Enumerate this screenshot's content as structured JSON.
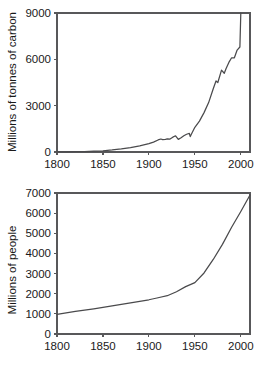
{
  "figure": {
    "background_color": "#ffffff",
    "line_color": "#4a4a4c",
    "axis_color": "#58585a",
    "text_color": "#1a1a1a"
  },
  "chart_data": [
    {
      "id": "carbon",
      "type": "line",
      "title": "",
      "xlabel": "",
      "ylabel": "Millions of tonnes of carbon",
      "xlim": [
        1800,
        2010
      ],
      "ylim": [
        0,
        9000
      ],
      "xticks": [
        1800,
        1850,
        1900,
        1950,
        2000
      ],
      "xticklabels": [
        "1800",
        "1850",
        "1900",
        "1950",
        "2000"
      ],
      "yticks": [
        0,
        3000,
        6000,
        9000
      ],
      "yticklabels": [
        "0",
        "3000",
        "6000",
        "9000"
      ],
      "grid": false,
      "legend": false,
      "series": [
        {
          "name": "Global carbon emissions from fossil fuels",
          "x": [
            1800,
            1810,
            1820,
            1830,
            1840,
            1850,
            1860,
            1870,
            1880,
            1890,
            1900,
            1905,
            1910,
            1913,
            1915,
            1918,
            1920,
            1923,
            1926,
            1929,
            1932,
            1935,
            1938,
            1941,
            1944,
            1945,
            1947,
            1950,
            1955,
            1960,
            1965,
            1970,
            1973,
            1975,
            1979,
            1982,
            1984,
            1987,
            1990,
            1993,
            1996,
            1999,
            2000
          ],
          "y": [
            8,
            12,
            18,
            30,
            50,
            80,
            130,
            200,
            290,
            400,
            540,
            640,
            780,
            840,
            800,
            820,
            850,
            840,
            960,
            1050,
            820,
            920,
            1050,
            1150,
            1200,
            1000,
            1250,
            1600,
            2000,
            2550,
            3200,
            4100,
            4600,
            4500,
            5300,
            5100,
            5400,
            5800,
            6100,
            6100,
            6600,
            6800,
            9000
          ]
        }
      ]
    },
    {
      "id": "population",
      "type": "line",
      "title": "",
      "xlabel": "",
      "ylabel": "Millions of people",
      "xlim": [
        1800,
        2010
      ],
      "ylim": [
        0,
        7000
      ],
      "xticks": [
        1800,
        1850,
        1900,
        1950,
        2000
      ],
      "xticklabels": [
        "1800",
        "1850",
        "1900",
        "1950",
        "2000"
      ],
      "yticks": [
        0,
        1000,
        2000,
        3000,
        4000,
        5000,
        6000,
        7000
      ],
      "yticklabels": [
        "0",
        "1000",
        "2000",
        "3000",
        "4000",
        "5000",
        "6000",
        "7000"
      ],
      "grid": false,
      "legend": false,
      "series": [
        {
          "name": "World population",
          "x": [
            1800,
            1820,
            1840,
            1860,
            1880,
            1900,
            1910,
            1920,
            1930,
            1940,
            1950,
            1960,
            1970,
            1980,
            1990,
            2000,
            2010
          ],
          "y": [
            980,
            1120,
            1250,
            1400,
            1550,
            1700,
            1800,
            1900,
            2100,
            2350,
            2550,
            3030,
            3700,
            4450,
            5300,
            6080,
            6900
          ]
        }
      ]
    }
  ]
}
